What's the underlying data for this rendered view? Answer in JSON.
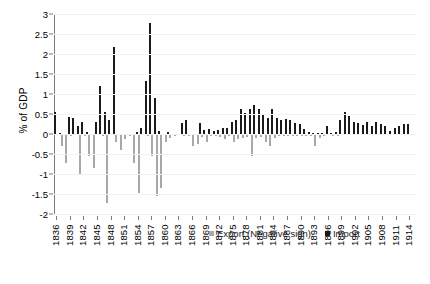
{
  "chart_data": {
    "type": "bar",
    "title": "",
    "xlabel": "",
    "ylabel": "% of GDP",
    "ylim": [
      -2,
      3
    ],
    "yticks": [
      3,
      2.5,
      2,
      1.5,
      1,
      0.5,
      0,
      -0.5,
      -1,
      -1.5,
      -2
    ],
    "ytick_labels": [
      "3",
      "2.5",
      "2",
      "1.5",
      "1",
      "0.5",
      "0",
      "-0.5",
      "-1",
      "-1.5",
      "-2"
    ],
    "grid": true,
    "legend_position": "bottom-right",
    "xtick_labels": [
      "1836",
      "1839",
      "1842",
      "1845",
      "1848",
      "1851",
      "1854",
      "1857",
      "1860",
      "1863",
      "1866",
      "1869",
      "1872",
      "1875",
      "1878",
      "1881",
      "1884",
      "1887",
      "1890",
      "1893",
      "1896",
      "1899",
      "1902",
      "1905",
      "1908",
      "1911",
      "1914"
    ],
    "xtick_step": 3,
    "x_start": 1836,
    "x_end": 1915,
    "legend": [
      {
        "name": "Export (Negative sign)",
        "color": "#a8a8a8"
      },
      {
        "name": "Import",
        "color": "#1a1a1a"
      }
    ],
    "series": [
      {
        "name": "Import",
        "color": "#1a1a1a",
        "x": [
          1836,
          1837,
          1838,
          1839,
          1840,
          1841,
          1842,
          1843,
          1844,
          1845,
          1846,
          1847,
          1848,
          1849,
          1850,
          1851,
          1852,
          1853,
          1854,
          1855,
          1856,
          1857,
          1858,
          1859,
          1860,
          1861,
          1862,
          1863,
          1864,
          1865,
          1866,
          1867,
          1868,
          1869,
          1870,
          1871,
          1872,
          1873,
          1874,
          1875,
          1876,
          1877,
          1878,
          1879,
          1880,
          1881,
          1882,
          1883,
          1884,
          1885,
          1886,
          1887,
          1888,
          1889,
          1890,
          1891,
          1892,
          1893,
          1894,
          1895,
          1896,
          1897,
          1898,
          1899,
          1900,
          1901,
          1902,
          1903,
          1904,
          1905,
          1906,
          1907,
          1908,
          1909,
          1910,
          1911,
          1912,
          1913,
          1914,
          1915
        ],
        "values": [
          0.55,
          0.02,
          0.0,
          0.42,
          0.4,
          0.2,
          0.3,
          0.06,
          0.0,
          0.3,
          1.2,
          0.55,
          0.35,
          2.18,
          0.0,
          0.0,
          0.0,
          0.0,
          0.05,
          0.15,
          1.32,
          2.77,
          0.9,
          0.07,
          0.0,
          0.06,
          0.0,
          0.0,
          0.28,
          0.36,
          0.0,
          0.0,
          0.28,
          0.1,
          0.12,
          0.08,
          0.1,
          0.14,
          0.16,
          0.3,
          0.36,
          0.62,
          0.52,
          0.62,
          0.72,
          0.62,
          0.5,
          0.4,
          0.62,
          0.4,
          0.36,
          0.38,
          0.36,
          0.28,
          0.24,
          0.12,
          0.06,
          0.03,
          0.02,
          0.03,
          0.2,
          0.02,
          0.06,
          0.34,
          0.56,
          0.46,
          0.3,
          0.28,
          0.22,
          0.3,
          0.2,
          0.3,
          0.26,
          0.2,
          0.08,
          0.14,
          0.2,
          0.24,
          0.26,
          0.0
        ]
      },
      {
        "name": "Export (Negative sign)",
        "color": "#a8a8a8",
        "x": [
          1836,
          1837,
          1838,
          1839,
          1840,
          1841,
          1842,
          1843,
          1844,
          1845,
          1846,
          1847,
          1848,
          1849,
          1850,
          1851,
          1852,
          1853,
          1854,
          1855,
          1856,
          1857,
          1858,
          1859,
          1860,
          1861,
          1862,
          1863,
          1864,
          1865,
          1866,
          1867,
          1868,
          1869,
          1870,
          1871,
          1872,
          1873,
          1874,
          1875,
          1876,
          1877,
          1878,
          1879,
          1880,
          1881,
          1882,
          1883,
          1884,
          1885,
          1886,
          1887,
          1888,
          1889,
          1890,
          1891,
          1892,
          1893,
          1894,
          1895,
          1896,
          1897,
          1898,
          1899,
          1900,
          1901,
          1902,
          1903,
          1904,
          1905,
          1906,
          1907,
          1908,
          1909,
          1910,
          1911,
          1912,
          1913,
          1914,
          1915
        ],
        "values": [
          -0.02,
          -0.3,
          -0.72,
          -0.05,
          -0.02,
          -1.0,
          -0.06,
          -0.55,
          -0.85,
          -0.02,
          -0.04,
          -1.72,
          -0.02,
          -0.2,
          -0.4,
          -0.12,
          -0.05,
          -0.72,
          -1.48,
          -0.02,
          -0.05,
          -0.55,
          -1.55,
          -1.35,
          -0.2,
          -0.1,
          -0.04,
          -0.02,
          -0.06,
          -0.06,
          -0.3,
          -0.26,
          -0.08,
          -0.2,
          -0.05,
          -0.06,
          -0.08,
          -0.12,
          -0.05,
          -0.2,
          -0.12,
          -0.1,
          -0.08,
          -0.55,
          -0.1,
          -0.08,
          -0.2,
          -0.3,
          -0.1,
          -0.06,
          -0.06,
          -0.06,
          -0.05,
          -0.05,
          -0.04,
          -0.05,
          -0.06,
          -0.3,
          -0.1,
          -0.06,
          -0.02,
          -0.04,
          -0.04,
          -0.02,
          -0.02,
          -0.02,
          -0.02,
          -0.02,
          -0.02,
          -0.02,
          -0.02,
          -0.02,
          -0.02,
          -0.02,
          -0.02,
          -0.02,
          -0.02,
          -0.02,
          -0.02,
          0.0
        ]
      }
    ]
  }
}
